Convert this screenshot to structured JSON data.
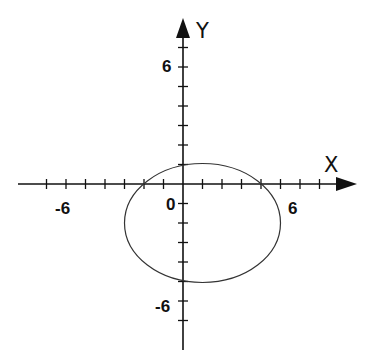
{
  "chart_data": {
    "type": "line",
    "title": "",
    "xlabel": "X",
    "ylabel": "Y",
    "xlim": [
      -7.5,
      8.5
    ],
    "ylim": [
      -8.5,
      8.5
    ],
    "x_ticks": [
      -7,
      -6,
      -5,
      -4,
      -3,
      -2,
      -1,
      1,
      2,
      3,
      4,
      5,
      6,
      7
    ],
    "y_ticks": [
      -7,
      -6,
      -5,
      -4,
      -3,
      -2,
      -1,
      1,
      2,
      3,
      4,
      5,
      6,
      7
    ],
    "tick_labels": {
      "x": [
        {
          "value": -6,
          "text": "-6"
        },
        {
          "value": 0,
          "text": "0"
        },
        {
          "value": 6,
          "text": "6"
        }
      ],
      "y": [
        {
          "value": 6,
          "text": "6"
        },
        {
          "value": -6,
          "text": "-6"
        }
      ]
    },
    "grid": false,
    "series": [
      {
        "name": "closed curve",
        "shape": "ellipse",
        "center": [
          1,
          -2
        ],
        "rx": 4,
        "ry": 3,
        "intercepts": {
          "x": [
            -2,
            4
          ],
          "y": [
            1,
            -5
          ]
        },
        "color": "#333333"
      }
    ]
  },
  "axes": {
    "x_label": "X",
    "y_label": "Y",
    "origin_label": "0",
    "x_neg_label": "-6",
    "x_pos_label": "6",
    "y_pos_label": "6",
    "y_neg_label": "-6"
  }
}
